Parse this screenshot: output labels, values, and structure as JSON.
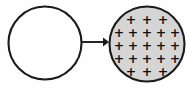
{
  "diagram": {
    "type": "physics-charge-transfer-diagram",
    "canvas": {
      "width": 196,
      "height": 89,
      "background": "#fefefe"
    },
    "colors": {
      "outline": "#1a1a1a",
      "neutral_fill": "#ffffff",
      "charged_fill": "#d5d5d5",
      "charge_symbol": "#111111",
      "arrow": "#1a1a1a"
    },
    "objects": [
      {
        "name": "neutral-sphere",
        "shape": "circle",
        "cx": 45,
        "cy": 43,
        "r": 36.5,
        "fill": "#ffffff",
        "charge_count": 0,
        "charge_symbol": ""
      },
      {
        "name": "charged-sphere",
        "shape": "circle",
        "cx": 147,
        "cy": 44,
        "r": 37.5,
        "fill": "#d5d5d5",
        "charge_count": 21,
        "charge_symbol": "+"
      }
    ],
    "arrow": {
      "name": "transfer-arrow",
      "x1": 82,
      "y1": 42,
      "x2": 103,
      "y2": 42,
      "head_tip_x": 109,
      "head_half_height": 4.6,
      "direction": "right"
    },
    "charge_rows": [
      {
        "row": 1,
        "count": 3,
        "y": 19,
        "symbols": [
          "+",
          "+",
          "+"
        ],
        "x_positions": [
          131,
          147,
          163
        ]
      },
      {
        "row": 2,
        "count": 5,
        "y": 32,
        "symbols": [
          "+",
          "+",
          "+",
          "+",
          "+"
        ],
        "x_positions": [
          119,
          133,
          147,
          161,
          175
        ]
      },
      {
        "row": 3,
        "count": 5,
        "y": 45,
        "symbols": [
          "+",
          "+",
          "+",
          "+",
          "+"
        ],
        "x_positions": [
          119,
          133,
          147,
          161,
          175
        ]
      },
      {
        "row": 4,
        "count": 5,
        "y": 58,
        "symbols": [
          "+",
          "+",
          "+",
          "+",
          "+"
        ],
        "x_positions": [
          119,
          133,
          147,
          161,
          175
        ]
      },
      {
        "row": 5,
        "count": 3,
        "y": 71,
        "symbols": [
          "+",
          "+",
          "+"
        ],
        "x_positions": [
          131,
          147,
          163
        ]
      }
    ]
  }
}
